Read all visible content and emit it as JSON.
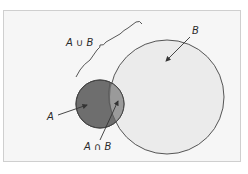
{
  "diagram": {
    "type": "venn",
    "sets": [
      {
        "id": "A",
        "label": "A",
        "color": "#6e6e6e"
      },
      {
        "id": "B",
        "label": "B",
        "color": "#e8e8e8"
      }
    ],
    "union_label": "A ∪ B",
    "intersection_label": "A ∩ B",
    "colors": {
      "background": "#f6f6f6",
      "frame": "#cfcfcf",
      "set_a_fill": "#6e6e6e",
      "set_b_fill": "#ebebeb",
      "intersection_fill": "#9a9a9a",
      "stroke": "#555555"
    }
  }
}
